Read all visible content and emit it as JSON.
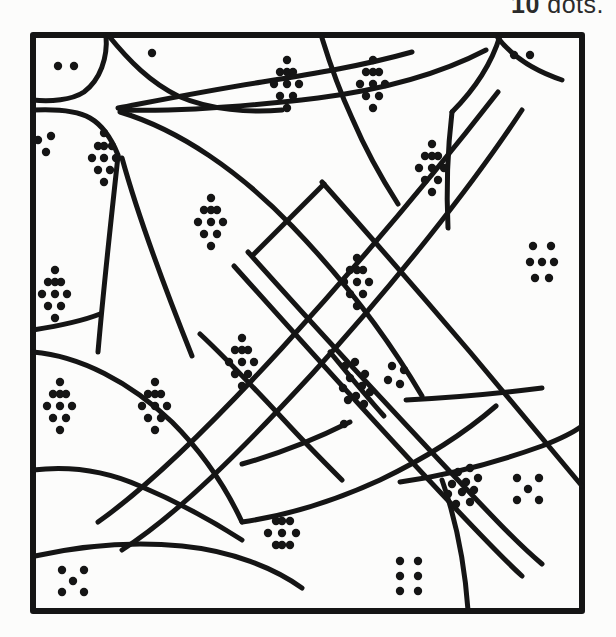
{
  "page": {
    "background_color": "#fcfcfb",
    "ink_color": "#151515"
  },
  "instruction": {
    "visible_fragment": "w 10 dots.",
    "full_text_guess": "Colour the sections which show 10 dots.",
    "highlighted_number": "10",
    "trailing_word": "dots.",
    "clipped": true
  },
  "frame": {
    "x": 30,
    "y": 32,
    "width": 555,
    "height": 582,
    "stroke_width": 6,
    "stroke_color": "#151515"
  },
  "regions": [
    {
      "id": "r-top-left-corner",
      "dot_count": 2,
      "label": "2",
      "target": false
    },
    {
      "id": "r-top-strip-left",
      "dot_count": 1,
      "label": "1",
      "target": false
    },
    {
      "id": "r-left-edge-upper",
      "dot_count": 3,
      "label": "3",
      "target": false
    },
    {
      "id": "r-upper-left-wedge",
      "dot_count": 10,
      "label": "10",
      "target": true
    },
    {
      "id": "r-top-middle-a",
      "dot_count": 10,
      "label": "10",
      "target": true
    },
    {
      "id": "r-top-middle-b",
      "dot_count": 10,
      "label": "10",
      "target": true
    },
    {
      "id": "r-top-right-corner",
      "dot_count": 2,
      "label": "2",
      "target": false
    },
    {
      "id": "r-upper-right-wedge",
      "dot_count": 10,
      "label": "10",
      "target": true
    },
    {
      "id": "r-center-upper-left",
      "dot_count": 10,
      "label": "10",
      "target": true
    },
    {
      "id": "r-left-middle",
      "dot_count": 10,
      "label": "10",
      "target": true
    },
    {
      "id": "r-center-band-upper",
      "dot_count": 10,
      "label": "10",
      "target": true
    },
    {
      "id": "r-right-middle",
      "dot_count": 7,
      "label": "7",
      "target": false
    },
    {
      "id": "r-center-diamond",
      "dot_count": 10,
      "label": "10",
      "target": true
    },
    {
      "id": "r-lower-left-a",
      "dot_count": 10,
      "label": "10",
      "target": true
    },
    {
      "id": "r-lower-left-b",
      "dot_count": 10,
      "label": "10",
      "target": true
    },
    {
      "id": "r-band-cross-left",
      "dot_count": 10,
      "label": "10",
      "target": true
    },
    {
      "id": "r-band-cross-right",
      "dot_count": 4,
      "label": "4",
      "target": false
    },
    {
      "id": "r-band-lone-dot",
      "dot_count": 1,
      "label": "1",
      "target": false
    },
    {
      "id": "r-lower-band-inner",
      "dot_count": 10,
      "label": "10",
      "target": true
    },
    {
      "id": "r-bottom-middle",
      "dot_count": 9,
      "label": "9",
      "target": false
    },
    {
      "id": "r-right-lower",
      "dot_count": 5,
      "label": "5",
      "target": false
    },
    {
      "id": "r-bottom-left-corner",
      "dot_count": 5,
      "label": "5",
      "target": false
    },
    {
      "id": "r-bottom-right",
      "dot_count": 6,
      "label": "6",
      "target": false
    }
  ],
  "dot_style": {
    "radius": 4.2,
    "color": "#151515"
  },
  "dot_groups": [
    {
      "region": "r-top-left-corner",
      "count": 2,
      "points": [
        [
          58,
          66
        ],
        [
          74,
          66
        ]
      ]
    },
    {
      "region": "r-top-strip-left",
      "count": 1,
      "points": [
        [
          152,
          53
        ]
      ]
    },
    {
      "region": "r-left-edge-upper",
      "count": 3,
      "points": [
        [
          38,
          140
        ],
        [
          51,
          136
        ],
        [
          46,
          152
        ]
      ]
    },
    {
      "region": "r-upper-left-wedge",
      "count": 10,
      "points": [
        [
          104,
          133
        ],
        [
          98,
          146
        ],
        [
          112,
          146
        ],
        [
          104,
          158
        ],
        [
          92,
          158
        ],
        [
          116,
          158
        ],
        [
          98,
          170
        ],
        [
          110,
          170
        ],
        [
          104,
          182
        ],
        [
          104,
          146
        ]
      ]
    },
    {
      "region": "r-top-middle-a",
      "count": 10,
      "points": [
        [
          287,
          60
        ],
        [
          280,
          72
        ],
        [
          293,
          72
        ],
        [
          274,
          84
        ],
        [
          287,
          84
        ],
        [
          299,
          84
        ],
        [
          280,
          96
        ],
        [
          293,
          96
        ],
        [
          287,
          108
        ],
        [
          287,
          72
        ]
      ]
    },
    {
      "region": "r-top-middle-b",
      "count": 10,
      "points": [
        [
          373,
          60
        ],
        [
          366,
          72
        ],
        [
          379,
          72
        ],
        [
          360,
          84
        ],
        [
          373,
          84
        ],
        [
          385,
          84
        ],
        [
          366,
          96
        ],
        [
          379,
          96
        ],
        [
          373,
          108
        ],
        [
          373,
          72
        ]
      ]
    },
    {
      "region": "r-top-right-corner",
      "count": 2,
      "points": [
        [
          514,
          55
        ],
        [
          530,
          55
        ]
      ]
    },
    {
      "region": "r-upper-right-wedge",
      "count": 10,
      "points": [
        [
          432,
          144
        ],
        [
          425,
          156
        ],
        [
          438,
          156
        ],
        [
          419,
          168
        ],
        [
          432,
          168
        ],
        [
          444,
          168
        ],
        [
          425,
          180
        ],
        [
          438,
          180
        ],
        [
          432,
          192
        ],
        [
          432,
          156
        ]
      ]
    },
    {
      "region": "r-center-upper-left",
      "count": 10,
      "points": [
        [
          211,
          198
        ],
        [
          204,
          210
        ],
        [
          217,
          210
        ],
        [
          198,
          222
        ],
        [
          211,
          222
        ],
        [
          223,
          222
        ],
        [
          204,
          234
        ],
        [
          217,
          234
        ],
        [
          211,
          246
        ],
        [
          211,
          210
        ]
      ]
    },
    {
      "region": "r-left-middle",
      "count": 10,
      "points": [
        [
          55,
          270
        ],
        [
          48,
          282
        ],
        [
          61,
          282
        ],
        [
          42,
          294
        ],
        [
          55,
          294
        ],
        [
          67,
          294
        ],
        [
          48,
          306
        ],
        [
          61,
          306
        ],
        [
          55,
          318
        ],
        [
          55,
          282
        ]
      ]
    },
    {
      "region": "r-center-band-upper",
      "count": 10,
      "points": [
        [
          357,
          258
        ],
        [
          350,
          270
        ],
        [
          363,
          270
        ],
        [
          344,
          282
        ],
        [
          357,
          282
        ],
        [
          369,
          282
        ],
        [
          350,
          294
        ],
        [
          363,
          294
        ],
        [
          357,
          306
        ],
        [
          357,
          270
        ]
      ]
    },
    {
      "region": "r-right-middle",
      "count": 7,
      "points": [
        [
          533,
          246
        ],
        [
          551,
          246
        ],
        [
          530,
          262
        ],
        [
          542,
          262
        ],
        [
          554,
          262
        ],
        [
          535,
          278
        ],
        [
          549,
          278
        ]
      ]
    },
    {
      "region": "r-center-diamond",
      "count": 10,
      "points": [
        [
          242,
          338
        ],
        [
          235,
          350
        ],
        [
          248,
          350
        ],
        [
          229,
          362
        ],
        [
          242,
          362
        ],
        [
          254,
          362
        ],
        [
          235,
          374
        ],
        [
          248,
          374
        ],
        [
          242,
          386
        ],
        [
          242,
          350
        ]
      ]
    },
    {
      "region": "r-lower-left-a",
      "count": 10,
      "points": [
        [
          60,
          382
        ],
        [
          53,
          394
        ],
        [
          66,
          394
        ],
        [
          47,
          406
        ],
        [
          60,
          406
        ],
        [
          72,
          406
        ],
        [
          53,
          418
        ],
        [
          66,
          418
        ],
        [
          60,
          430
        ],
        [
          60,
          394
        ]
      ]
    },
    {
      "region": "r-lower-left-b",
      "count": 10,
      "points": [
        [
          155,
          382
        ],
        [
          148,
          394
        ],
        [
          161,
          394
        ],
        [
          142,
          406
        ],
        [
          155,
          406
        ],
        [
          167,
          406
        ],
        [
          148,
          418
        ],
        [
          161,
          418
        ],
        [
          155,
          430
        ],
        [
          155,
          394
        ]
      ]
    },
    {
      "region": "r-band-cross-left",
      "count": 10,
      "points": [
        [
          345,
          366
        ],
        [
          355,
          362
        ],
        [
          365,
          374
        ],
        [
          350,
          378
        ],
        [
          362,
          386
        ],
        [
          343,
          388
        ],
        [
          356,
          396
        ],
        [
          370,
          392
        ],
        [
          348,
          400
        ],
        [
          364,
          404
        ]
      ]
    },
    {
      "region": "r-band-cross-right",
      "count": 4,
      "points": [
        [
          392,
          366
        ],
        [
          404,
          370
        ],
        [
          388,
          380
        ],
        [
          400,
          384
        ]
      ]
    },
    {
      "region": "r-band-lone-dot",
      "count": 1,
      "points": [
        [
          344,
          424
        ]
      ]
    },
    {
      "region": "r-lower-band-inner",
      "count": 10,
      "points": [
        [
          458,
          472
        ],
        [
          470,
          468
        ],
        [
          452,
          484
        ],
        [
          466,
          482
        ],
        [
          478,
          478
        ],
        [
          448,
          494
        ],
        [
          462,
          492
        ],
        [
          474,
          490
        ],
        [
          456,
          504
        ],
        [
          470,
          502
        ]
      ]
    },
    {
      "region": "r-bottom-middle",
      "count": 9,
      "points": [
        [
          276,
          521
        ],
        [
          290,
          521
        ],
        [
          268,
          533
        ],
        [
          282,
          533
        ],
        [
          296,
          533
        ],
        [
          276,
          545
        ],
        [
          290,
          545
        ],
        [
          282,
          521
        ],
        [
          282,
          545
        ]
      ]
    },
    {
      "region": "r-right-lower",
      "count": 5,
      "points": [
        [
          517,
          478
        ],
        [
          539,
          478
        ],
        [
          528,
          489
        ],
        [
          517,
          500
        ],
        [
          539,
          500
        ]
      ]
    },
    {
      "region": "r-bottom-left-corner",
      "count": 5,
      "points": [
        [
          62,
          570
        ],
        [
          84,
          570
        ],
        [
          73,
          581
        ],
        [
          62,
          592
        ],
        [
          84,
          592
        ]
      ]
    },
    {
      "region": "r-bottom-right",
      "count": 6,
      "points": [
        [
          400,
          561
        ],
        [
          418,
          561
        ],
        [
          400,
          576
        ],
        [
          418,
          576
        ],
        [
          400,
          591
        ],
        [
          418,
          591
        ]
      ]
    }
  ],
  "paths": {
    "stroke_color": "#151515",
    "description": "Hand-drawn puzzle outline: curved cell boundaries plus two crossing diagonal bands",
    "segments": [
      {
        "id": "p-top-left-arc",
        "d": "M 33 100 C 50 102 72 100 84 92 C 100 80 108 58 106 35"
      },
      {
        "id": "p-top-left-lower",
        "d": "M 33 110 C 54 109 76 110 90 118 C 104 126 112 140 118 155"
      },
      {
        "id": "p-top-strip-to-apex",
        "d": "M 108 35 C 130 62 150 82 178 96 C 210 110 250 113 282 110"
      },
      {
        "id": "p-apex-to-right",
        "d": "M 118 108 C 160 100 210 90 262 82 C 312 74 362 66 412 52"
      },
      {
        "id": "p-fan-upper",
        "d": "M 120 110 C 180 112 250 106 318 98 C 380 90 440 74 486 50"
      },
      {
        "id": "p-right-upper-curve",
        "d": "M 500 36 C 492 62 476 88 452 112"
      },
      {
        "id": "p-top-right-wedge",
        "d": "M 498 38 C 512 56 530 72 560 82"
      },
      {
        "id": "p-big-left-curve",
        "d": "M 120 112 C 180 130 240 170 290 222 C 340 274 384 330 420 390"
      },
      {
        "id": "p-left-v-a",
        "d": "M 118 156 C 112 210 104 280 98 350"
      },
      {
        "id": "p-left-v-b",
        "d": "M 122 158 C 138 214 162 282 190 352"
      },
      {
        "id": "p-left-mid-h",
        "d": "M 33 330 C 58 326 80 322 100 314"
      },
      {
        "id": "p-left-arc-lower",
        "d": "M 33 352 C 80 356 130 380 170 420 C 204 454 226 490 240 520"
      },
      {
        "id": "p-left-bottom-arc",
        "d": "M 33 470 C 66 466 104 470 140 486 C 178 502 212 522 240 540"
      },
      {
        "id": "p-bottom-left-sweep",
        "d": "M 35 555 C 80 545 130 540 180 545 C 230 550 272 566 300 586"
      },
      {
        "id": "p-bottom-mid-curve",
        "d": "M 238 520 C 280 514 330 500 378 478 C 424 456 466 430 496 404"
      },
      {
        "id": "p-right-lower-arc",
        "d": "M 400 480 C 440 474 490 462 540 444 C 558 437 572 430 582 424"
      },
      {
        "id": "p-bottom-right-vert",
        "d": "M 440 478 C 452 512 462 552 466 612"
      },
      {
        "id": "p-band-a-upper",
        "d": "M 496 90 C 440 162 360 258 280 346 C 214 418 150 482 96 520"
      },
      {
        "id": "p-band-a-lower",
        "d": "M 520 108 C 470 184 392 282 310 372 C 240 448 176 512 120 548"
      },
      {
        "id": "p-band-inner-a",
        "d": "M 232 264 C 300 340 372 420 438 490 C 470 524 498 554 520 574"
      },
      {
        "id": "p-band-inner-b",
        "d": "M 246 250 C 314 326 388 406 454 476 C 488 512 516 542 540 562"
      },
      {
        "id": "p-cross-diag",
        "d": "M 322 182 C 370 236 424 298 470 352 C 512 402 552 450 582 486"
      },
      {
        "id": "p-mid-cell-a",
        "d": "M 318 186 C 300 204 276 228 250 254"
      },
      {
        "id": "p-mid-cell-b",
        "d": "M 200 332 C 226 358 254 388 282 418 C 304 442 324 462 340 478"
      },
      {
        "id": "p-mid-cell-c",
        "d": "M 240 462 C 276 452 312 438 348 420"
      },
      {
        "id": "p-star-center",
        "d": "M 330 352 C 346 372 362 392 378 410"
      },
      {
        "id": "p-right-fan",
        "d": "M 404 398 C 444 396 492 392 540 386"
      },
      {
        "id": "p-right-fan-2",
        "d": "M 398 404 C 430 424 466 448 500 472"
      }
    ]
  }
}
